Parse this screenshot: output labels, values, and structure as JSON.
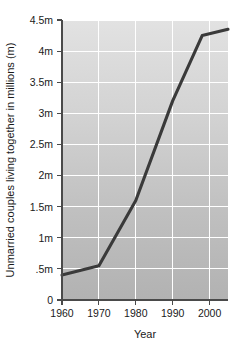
{
  "chart_data": {
    "type": "line",
    "title": "",
    "xlabel": "Year",
    "ylabel": "Unmarried couples living together in millions (m)",
    "xlim": [
      1960,
      2005
    ],
    "ylim": [
      0,
      4.5
    ],
    "grid": true,
    "legend_position": "none",
    "x_tick_labels": [
      "1960",
      "1970",
      "1980",
      "1990",
      "2000"
    ],
    "x_tick_values": [
      1960,
      1970,
      1980,
      1990,
      2000
    ],
    "y_tick_labels": [
      "0",
      ".5m",
      "1m",
      "1.5m",
      "2m",
      "2.5m",
      "3m",
      "3.5m",
      "4m",
      "4.5m"
    ],
    "y_tick_values": [
      0,
      0.5,
      1,
      1.5,
      2,
      2.5,
      3,
      3.5,
      4,
      4.5
    ],
    "series": [
      {
        "name": "Unmarried couples living together",
        "color": "#3a3a3a",
        "x": [
          1960,
          1970,
          1980,
          1990,
          1998,
          2005
        ],
        "values": [
          0.4,
          0.55,
          1.6,
          3.2,
          4.25,
          4.35
        ]
      }
    ]
  },
  "figure": {
    "background_color": "#ffffff",
    "plot_background_top": "#e0e0e0",
    "plot_background_bottom": "#b4b4b4",
    "gridline_color": "#ffffff",
    "axis_color": "#4a4a4a"
  }
}
